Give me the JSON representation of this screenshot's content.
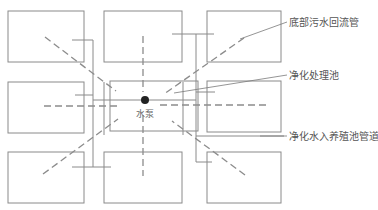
{
  "diagram": {
    "type": "aquaculture-circulation-layout",
    "tanks": [
      {
        "id": "top-left",
        "role": "breeding-pond"
      },
      {
        "id": "top-middle",
        "role": "breeding-pond"
      },
      {
        "id": "top-right",
        "role": "breeding-pond"
      },
      {
        "id": "middle-left",
        "role": "breeding-pond"
      },
      {
        "id": "center",
        "role": "purification-pond"
      },
      {
        "id": "middle-right",
        "role": "breeding-pond"
      },
      {
        "id": "bottom-left",
        "role": "breeding-pond"
      },
      {
        "id": "bottom-middle",
        "role": "breeding-pond"
      },
      {
        "id": "bottom-right",
        "role": "breeding-pond"
      }
    ],
    "labels": {
      "bottom_sewage_return_pipe": "底部污水回流管",
      "purification_pond": "净化处理池",
      "clean_water_inlet_pipe": "净化水入养殖池管道",
      "pump": "水泵"
    },
    "colors": {
      "line": "#8a8a8a",
      "text": "#555555",
      "pump": "#222222"
    }
  }
}
